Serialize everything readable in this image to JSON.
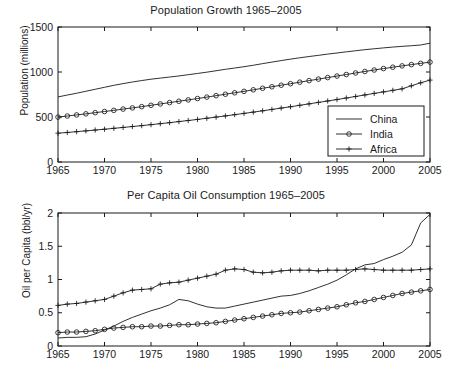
{
  "figure": {
    "background": "#ffffff",
    "ink": "#1a1a1a"
  },
  "chart_data": [
    {
      "type": "line",
      "id": "population-growth",
      "title": "Population Growth 1965–2005",
      "xlabel": "",
      "ylabel": "Population (millions)",
      "xlim": [
        1965,
        2005
      ],
      "ylim": [
        0,
        1500
      ],
      "xticks": [
        1965,
        1970,
        1975,
        1980,
        1985,
        1990,
        1995,
        2000,
        2005
      ],
      "xticklabels": [
        "1965",
        "1970",
        "1975",
        "1980",
        "1985",
        "1990",
        "1995",
        "2000",
        "2005"
      ],
      "yticks": [
        0,
        500,
        1000,
        1500
      ],
      "yticklabels": [
        "0",
        "500",
        "1000",
        "1500"
      ],
      "grid": false,
      "legend_position": "lower right",
      "x": [
        1965,
        1966,
        1967,
        1968,
        1969,
        1970,
        1971,
        1972,
        1973,
        1974,
        1975,
        1976,
        1977,
        1978,
        1979,
        1980,
        1981,
        1982,
        1983,
        1984,
        1985,
        1986,
        1987,
        1988,
        1989,
        1990,
        1991,
        1992,
        1993,
        1994,
        1995,
        1996,
        1997,
        1998,
        1999,
        2000,
        2001,
        2002,
        2003,
        2004,
        2005
      ],
      "series": [
        {
          "name": "China",
          "marker": "none",
          "values": [
            723,
            744,
            764,
            786,
            808,
            830,
            852,
            871,
            889,
            905,
            920,
            932,
            944,
            956,
            970,
            984,
            998,
            1014,
            1030,
            1044,
            1059,
            1075,
            1093,
            1110,
            1127,
            1143,
            1158,
            1172,
            1185,
            1199,
            1211,
            1224,
            1236,
            1248,
            1258,
            1268,
            1277,
            1285,
            1292,
            1300,
            1320
          ]
        },
        {
          "name": "India",
          "marker": "circle",
          "values": [
            499,
            511,
            523,
            535,
            548,
            561,
            574,
            588,
            601,
            615,
            630,
            645,
            660,
            675,
            690,
            705,
            721,
            737,
            753,
            769,
            785,
            802,
            819,
            836,
            853,
            870,
            887,
            904,
            921,
            938,
            955,
            972,
            989,
            1006,
            1022,
            1038,
            1053,
            1068,
            1082,
            1096,
            1110
          ]
        },
        {
          "name": "Africa",
          "marker": "plus",
          "values": [
            320,
            328,
            337,
            346,
            355,
            364,
            374,
            384,
            394,
            404,
            415,
            426,
            437,
            449,
            461,
            473,
            486,
            499,
            512,
            526,
            540,
            554,
            569,
            584,
            599,
            614,
            630,
            646,
            662,
            678,
            694,
            711,
            728,
            745,
            762,
            779,
            796,
            813,
            847,
            880,
            910
          ]
        }
      ]
    },
    {
      "type": "line",
      "id": "per-capita-oil-consumption",
      "title": "Per Capita Oil Consumption 1965–2005",
      "xlabel": "",
      "ylabel": "Oil per Capita (bbl/yr)",
      "xlim": [
        1965,
        2005
      ],
      "ylim": [
        0,
        2
      ],
      "xticks": [
        1965,
        1970,
        1975,
        1980,
        1985,
        1990,
        1995,
        2000,
        2005
      ],
      "xticklabels": [
        "1965",
        "1970",
        "1975",
        "1980",
        "1985",
        "1990",
        "1995",
        "2000",
        "2005"
      ],
      "yticks": [
        0,
        0.5,
        1,
        1.5,
        2
      ],
      "yticklabels": [
        "0",
        "0.5",
        "1",
        "1.5",
        "2"
      ],
      "grid": false,
      "legend_position": "none",
      "x": [
        1965,
        1966,
        1967,
        1968,
        1969,
        1970,
        1971,
        1972,
        1973,
        1974,
        1975,
        1976,
        1977,
        1978,
        1979,
        1980,
        1981,
        1982,
        1983,
        1984,
        1985,
        1986,
        1987,
        1988,
        1989,
        1990,
        1991,
        1992,
        1993,
        1994,
        1995,
        1996,
        1997,
        1998,
        1999,
        2000,
        2001,
        2002,
        2003,
        2004,
        2005
      ],
      "series": [
        {
          "name": "China",
          "marker": "none",
          "values": [
            0.12,
            0.13,
            0.13,
            0.14,
            0.18,
            0.24,
            0.3,
            0.37,
            0.43,
            0.48,
            0.53,
            0.57,
            0.62,
            0.7,
            0.68,
            0.63,
            0.59,
            0.57,
            0.57,
            0.6,
            0.63,
            0.66,
            0.69,
            0.72,
            0.75,
            0.76,
            0.79,
            0.83,
            0.88,
            0.93,
            0.99,
            1.07,
            1.16,
            1.22,
            1.24,
            1.3,
            1.35,
            1.41,
            1.52,
            1.85,
            1.98
          ]
        },
        {
          "name": "India",
          "marker": "circle",
          "values": [
            0.2,
            0.21,
            0.21,
            0.22,
            0.23,
            0.25,
            0.27,
            0.28,
            0.29,
            0.29,
            0.3,
            0.3,
            0.31,
            0.32,
            0.32,
            0.33,
            0.34,
            0.35,
            0.37,
            0.39,
            0.41,
            0.43,
            0.45,
            0.47,
            0.49,
            0.5,
            0.51,
            0.53,
            0.55,
            0.57,
            0.59,
            0.62,
            0.65,
            0.67,
            0.7,
            0.73,
            0.76,
            0.79,
            0.81,
            0.83,
            0.85
          ]
        },
        {
          "name": "Africa",
          "marker": "plus",
          "values": [
            0.61,
            0.63,
            0.64,
            0.66,
            0.68,
            0.7,
            0.75,
            0.8,
            0.84,
            0.85,
            0.86,
            0.93,
            0.95,
            0.96,
            0.99,
            1.02,
            1.05,
            1.08,
            1.14,
            1.16,
            1.15,
            1.11,
            1.1,
            1.11,
            1.13,
            1.14,
            1.14,
            1.14,
            1.13,
            1.14,
            1.14,
            1.14,
            1.15,
            1.16,
            1.15,
            1.14,
            1.14,
            1.14,
            1.14,
            1.15,
            1.16
          ]
        }
      ]
    }
  ],
  "legend": {
    "entries": [
      {
        "label": "China",
        "marker": "none"
      },
      {
        "label": "India",
        "marker": "circle"
      },
      {
        "label": "Africa",
        "marker": "plus"
      }
    ]
  }
}
